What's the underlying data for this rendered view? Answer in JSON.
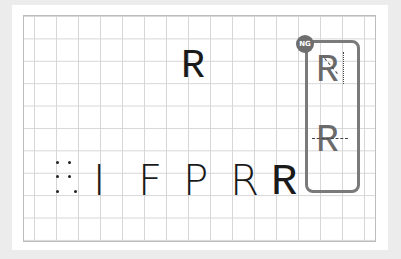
{
  "diagram": {
    "type": "letter-evolution-grid",
    "sequence": {
      "proto_symbol": "⁚",
      "stages": [
        "I",
        "F",
        "P",
        "R",
        "R"
      ]
    },
    "featured_letter": "R",
    "comparison_panel": {
      "badge": "NG",
      "examples": [
        "R",
        "R"
      ],
      "notes": [
        "dotted vertical and diagonal guide on leg",
        "dashed horizontal guide through bowl"
      ]
    },
    "colors": {
      "background": "#ececec",
      "grid_line": "#d6d6d6",
      "glyph": "#1a1a1a",
      "frame": "#7a7a7a",
      "badge": "#6e6e6e"
    }
  }
}
